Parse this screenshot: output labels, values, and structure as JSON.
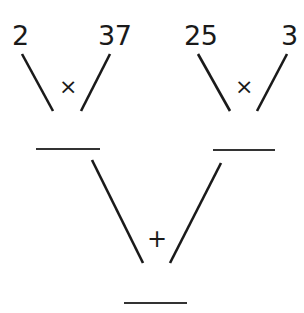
{
  "diagram": {
    "left_group": {
      "a": "2",
      "b": "37",
      "operator": "×",
      "result_blank": ""
    },
    "right_group": {
      "a": "25",
      "b": "3",
      "operator": "×",
      "result_blank": ""
    },
    "combine": {
      "operator": "+",
      "result_blank": ""
    }
  }
}
